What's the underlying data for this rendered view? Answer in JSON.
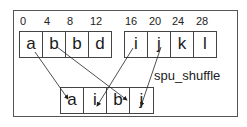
{
  "diagram": {
    "offsets": [
      "0",
      "4",
      "8",
      "12",
      "16",
      "20",
      "24",
      "28"
    ],
    "vector_a": [
      "a",
      "b",
      "b",
      "d"
    ],
    "vector_b": [
      "i",
      "j",
      "k",
      "l"
    ],
    "result": [
      "a",
      "i",
      "b",
      "j"
    ],
    "operation_label": "spu_shuffle"
  }
}
